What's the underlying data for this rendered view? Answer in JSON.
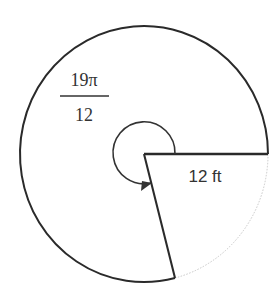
{
  "diagram": {
    "type": "circle-sector",
    "angle_label": {
      "numerator": "19π",
      "denominator": "12"
    },
    "radius_label": "12 ft",
    "colors": {
      "stroke": "#2a2a2a",
      "faint_arc": "#c8c8c8",
      "text": "#333333",
      "background": "#ffffff"
    }
  }
}
